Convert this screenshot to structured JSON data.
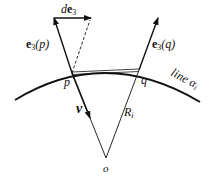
{
  "diagram": {
    "labels": {
      "de3_d": "d",
      "de3_e": "e",
      "de3_sub": "3",
      "e3p_e": "e",
      "e3p_sub": "3",
      "e3p_arg": "(p)",
      "e3q_e": "e",
      "e3q_sub": "3",
      "e3q_arg": "(q)",
      "p": "p",
      "q": "q",
      "nu": "ν",
      "Ri_R": "R",
      "Ri_sub": "i",
      "o": "o",
      "line_text": "line ",
      "line_alpha": "α",
      "line_sub": "i"
    },
    "colors": {
      "stroke": "#111111",
      "background": "#ffffff"
    }
  }
}
